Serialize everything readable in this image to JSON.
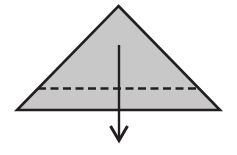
{
  "canvas": {
    "width": 237,
    "height": 155,
    "background_color": "#ffffff"
  },
  "diagram": {
    "type": "paper-folding-instruction",
    "shapes": {
      "triangle": {
        "name": "folded-paper-triangle",
        "points": "118.5,6 220,110 17,110",
        "fill_color": "#c8c8c8",
        "stroke_color": "#231f20",
        "stroke_width": 2.6
      },
      "fold_line": {
        "name": "horizontal-fold-crease",
        "x1": 38,
        "y1": 88.5,
        "x2": 199,
        "y2": 88.5,
        "stroke_color": "#231f20",
        "stroke_width": 2.4,
        "dash_pattern": "8 4.5"
      },
      "arrow": {
        "name": "downward-fold-arrow",
        "shaft_x": 119,
        "shaft_y1": 45,
        "shaft_y2": 140,
        "head_points": "110.5,126 119,140.5 127.5,126",
        "stroke_color": "#231f20",
        "stroke_width": 2.4,
        "head_stroke_width": 3.0,
        "direction": "down"
      }
    }
  }
}
